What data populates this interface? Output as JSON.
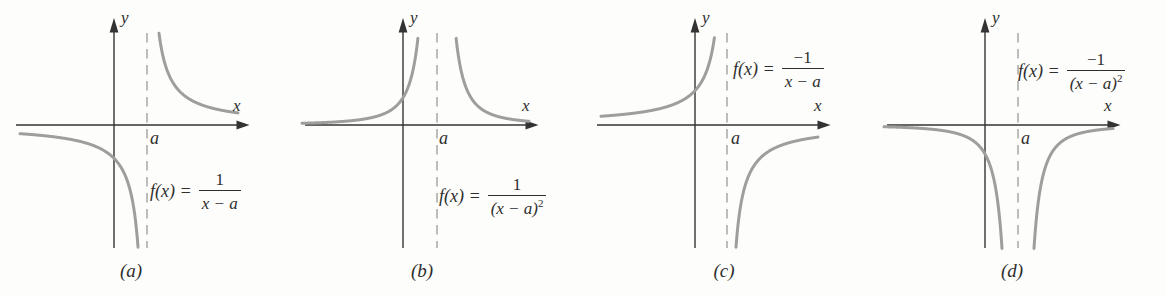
{
  "figure_title": "Graphs of rational functions with a vertical asymptote at x = a",
  "colors": {
    "curve": "#9e9e9e",
    "axis": "#333333",
    "dashed": "#a6a6a6",
    "text": "#2e2e2e",
    "background": "#fdfdfb"
  },
  "panels": [
    {
      "id": "a",
      "caption": "(a)",
      "ylabel": "y",
      "xlabel": "x",
      "asymptote_label": "a",
      "formula": {
        "lhs": "f(x) =",
        "num": "1",
        "den_base": "x − a",
        "den_sup": ""
      }
    },
    {
      "id": "b",
      "caption": "(b)",
      "ylabel": "y",
      "xlabel": "x",
      "asymptote_label": "a",
      "formula": {
        "lhs": "f(x) =",
        "num": "1",
        "den_base": "(x − a)",
        "den_sup": "2"
      }
    },
    {
      "id": "c",
      "caption": "(c)",
      "ylabel": "y",
      "xlabel": "x",
      "asymptote_label": "a",
      "formula": {
        "lhs": "f(x) =",
        "num": "−1",
        "den_base": "x − a",
        "den_sup": ""
      }
    },
    {
      "id": "d",
      "caption": "(d)",
      "ylabel": "y",
      "xlabel": "x",
      "asymptote_label": "a",
      "formula": {
        "lhs": "f(x) =",
        "num": "−1",
        "den_base": "(x − a)",
        "den_sup": "2"
      }
    }
  ],
  "chart_data": [
    {
      "panel": "a",
      "type": "line",
      "function": "f(x) = 1/(x − a)",
      "vertical_asymptote": "x = a",
      "horizontal_asymptote": "y = 0",
      "xlabel": "x",
      "ylabel": "y",
      "axes_numeric_scale": "none (qualitative sketch)",
      "branches": [
        "x < a: y → 0⁻ as x → −∞ and y → −∞ as x → a⁻ (curve below x-axis)",
        "x > a: y → +∞ as x → a⁺ and y → 0⁺ as x → +∞ (curve above x-axis)"
      ]
    },
    {
      "panel": "b",
      "type": "line",
      "function": "f(x) = 1/(x − a)²",
      "vertical_asymptote": "x = a",
      "horizontal_asymptote": "y = 0",
      "xlabel": "x",
      "ylabel": "y",
      "axes_numeric_scale": "none (qualitative sketch)",
      "branches": [
        "x < a: y → 0⁺ as x → −∞ and y → +∞ as x → a⁻ (curve above x-axis)",
        "x > a: y → +∞ as x → a⁺ and y → 0⁺ as x → +∞ (curve above x-axis)"
      ]
    },
    {
      "panel": "c",
      "type": "line",
      "function": "f(x) = −1/(x − a)",
      "vertical_asymptote": "x = a",
      "horizontal_asymptote": "y = 0",
      "xlabel": "x",
      "ylabel": "y",
      "axes_numeric_scale": "none (qualitative sketch)",
      "branches": [
        "x < a: y → 0⁺ as x → −∞ and y → +∞ as x → a⁻ (curve above x-axis)",
        "x > a: y → −∞ as x → a⁺ and y → 0⁻ as x → +∞ (curve below x-axis)"
      ]
    },
    {
      "panel": "d",
      "type": "line",
      "function": "f(x) = −1/(x − a)²",
      "vertical_asymptote": "x = a",
      "horizontal_asymptote": "y = 0",
      "xlabel": "x",
      "ylabel": "y",
      "axes_numeric_scale": "none (qualitative sketch)",
      "branches": [
        "x < a: y → 0⁻ as x → −∞ and y → −∞ as x → a⁻ (curve below x-axis)",
        "x > a: y → −∞ as x → a⁺ and y → 0⁻ as x → +∞ (curve below x-axis)"
      ]
    }
  ]
}
